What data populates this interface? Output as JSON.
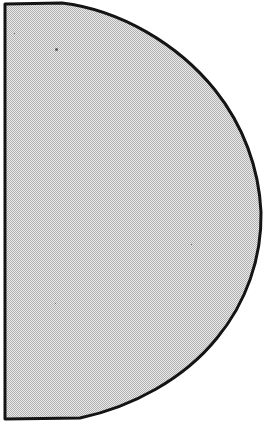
{
  "figure": {
    "title": "Half-disc shaded figure",
    "shape_name": "half-disc",
    "background_color": "#ffffff",
    "fill_color": "#c9c9c9",
    "dither_light_color": "#e8e8e8",
    "dither_dark_color": "#b0b0b0",
    "outline_color": "#141414",
    "outline_width_px": 3,
    "canvas": {
      "width": 266,
      "height": 425
    },
    "geometry": {
      "flat_edge_x": 4,
      "flat_edge_top_y": 4,
      "flat_edge_bottom_y": 419,
      "rightmost_x": 261,
      "rightmost_y": 212,
      "top_flat_end_x": 62,
      "bottom_flat_end_x": 80,
      "outline_path": "M 5,4 L 62,3 C 120,10 178,44 215,90 C 243,125 259,168 261,212 C 262,258 246,303 217,338 C 184,379 132,407 80,418 L 5,419 Z"
    },
    "boundary_samples": [
      {
        "x": 5,
        "y": 4
      },
      {
        "x": 62,
        "y": 3
      },
      {
        "x": 120,
        "y": 12
      },
      {
        "x": 180,
        "y": 48
      },
      {
        "x": 225,
        "y": 108
      },
      {
        "x": 250,
        "y": 160
      },
      {
        "x": 261,
        "y": 212
      },
      {
        "x": 255,
        "y": 250
      },
      {
        "x": 232,
        "y": 330
      },
      {
        "x": 200,
        "y": 372
      },
      {
        "x": 140,
        "y": 395
      },
      {
        "x": 80,
        "y": 418
      },
      {
        "x": 5,
        "y": 419
      }
    ],
    "specks": [
      {
        "x": 55,
        "y": 48,
        "size": 3
      },
      {
        "x": 14,
        "y": 33,
        "size": 1
      },
      {
        "x": 55,
        "y": 303,
        "size": 1
      },
      {
        "x": 191,
        "y": 244,
        "size": 1
      }
    ]
  }
}
